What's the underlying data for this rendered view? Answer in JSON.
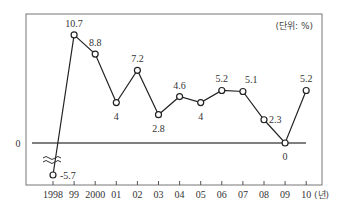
{
  "chart_data": {
    "type": "line",
    "title": "",
    "unit_label": "(단위: %)",
    "x_unit_label": "(년)",
    "xlabel": "",
    "ylabel": "",
    "categories": [
      "1998",
      "99",
      "2000",
      "01",
      "02",
      "03",
      "04",
      "05",
      "06",
      "07",
      "08",
      "09",
      "10"
    ],
    "series": [
      {
        "name": "growth",
        "values": [
          -5.7,
          10.7,
          8.8,
          4,
          7.2,
          2.8,
          4.6,
          4,
          5.2,
          5.1,
          2.3,
          0,
          5.2
        ]
      }
    ],
    "value_labels": [
      "-5.7",
      "10.7",
      "8.8",
      "4",
      "7.2",
      "2.8",
      "4.6",
      "4",
      "5.2",
      "5.1",
      "2.3",
      "0",
      "5.2"
    ],
    "zero_label": "0",
    "axis_break": true,
    "grid": false,
    "legend": null
  },
  "colors": {
    "line": "#222222",
    "frame": "#666666",
    "zero_line": "#555555",
    "marker_fill": "#ffffff"
  }
}
